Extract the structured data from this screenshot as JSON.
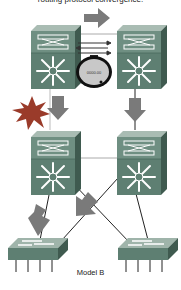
{
  "diagram": {
    "top_caption": "routing protocol convergence.",
    "bottom_caption": "Model B",
    "stopwatch_display": "0000.00",
    "nodes": [
      {
        "id": "core-left",
        "type": "multilayer-switch",
        "position": "top-left"
      },
      {
        "id": "core-right",
        "type": "multilayer-switch",
        "position": "top-right"
      },
      {
        "id": "dist-left",
        "type": "multilayer-switch",
        "position": "middle-left"
      },
      {
        "id": "dist-right",
        "type": "multilayer-switch",
        "position": "middle-right"
      },
      {
        "id": "access-left",
        "type": "workgroup-switch",
        "position": "bottom-left"
      },
      {
        "id": "access-right",
        "type": "workgroup-switch",
        "position": "bottom-right"
      }
    ],
    "links": [
      {
        "from": "core-left",
        "to": "core-right"
      },
      {
        "from": "core-left",
        "to": "dist-left",
        "status": "failed"
      },
      {
        "from": "core-right",
        "to": "dist-right"
      },
      {
        "from": "dist-left",
        "to": "dist-right"
      },
      {
        "from": "dist-left",
        "to": "access-left"
      },
      {
        "from": "dist-left",
        "to": "access-right"
      },
      {
        "from": "dist-right",
        "to": "access-left"
      },
      {
        "from": "dist-right",
        "to": "access-right"
      }
    ],
    "annotations": [
      {
        "type": "traffic-arrow",
        "direction": "right",
        "position": "top-center"
      },
      {
        "type": "exchange-arrows",
        "position": "between-core"
      },
      {
        "type": "stopwatch",
        "position": "between-core"
      },
      {
        "type": "failure-burst",
        "position": "left-uplink"
      },
      {
        "type": "traffic-arrow",
        "direction": "down",
        "position": "left-uplink"
      },
      {
        "type": "traffic-arrow",
        "direction": "down",
        "position": "right-uplink"
      },
      {
        "type": "traffic-arrow",
        "direction": "down-left",
        "position": "left-access"
      },
      {
        "type": "traffic-arrow",
        "direction": "down-left",
        "position": "center-cross"
      }
    ],
    "colors": {
      "switch_front": "#5e7f72",
      "switch_top": "#8fa79c",
      "switch_side": "#3f5a4f",
      "arrow": "#7a7a7a",
      "burst": "#9a3b2a",
      "link": "#222222",
      "link_light": "#aaaaaa"
    }
  }
}
